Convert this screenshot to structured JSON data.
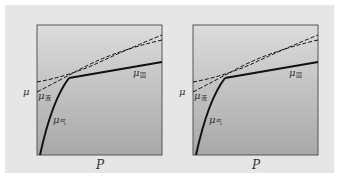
{
  "figure": {
    "panels": [
      {
        "id": "left",
        "y_axis_label": "μ",
        "x_axis_label": "P",
        "labels": {
          "solid": {
            "symbol": "μ",
            "sub": "固"
          },
          "liquid": {
            "symbol": "μ",
            "sub": "液"
          },
          "gas": {
            "symbol": "μ",
            "sub": "气"
          }
        }
      },
      {
        "id": "right",
        "y_axis_label": "μ",
        "x_axis_label": "P",
        "labels": {
          "solid": {
            "symbol": "μ",
            "sub": "固"
          },
          "liquid": {
            "symbol": "μ",
            "sub": "液"
          },
          "gas": {
            "symbol": "μ",
            "sub": "气"
          }
        }
      }
    ]
  },
  "colors": {
    "background": "#e6e6e6",
    "plot_top": "#d8d8d8",
    "plot_bottom": "#a9a9a9",
    "line": "#111111"
  }
}
